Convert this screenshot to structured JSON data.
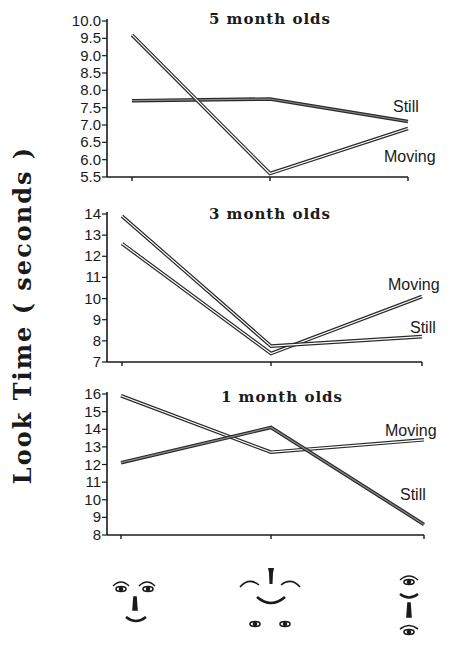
{
  "figure": {
    "ylabel": "Look Time ( seconds )"
  },
  "chart_data": [
    {
      "type": "line",
      "title": "5 month olds",
      "xlabel": "",
      "ylabel": "Look Time ( seconds )",
      "categories": [
        "face-normal",
        "face-scrambled",
        "face-vertical"
      ],
      "ylim": [
        5.5,
        10.0
      ],
      "yticks": [
        "10.0",
        "9.5",
        "9.0",
        "8.5",
        "8.0",
        "7.5",
        "7.0",
        "6.5",
        "6.0",
        "5.5"
      ],
      "series": [
        {
          "name": "Still",
          "values": [
            7.7,
            7.75,
            7.1
          ]
        },
        {
          "name": "Moving",
          "values": [
            9.6,
            5.6,
            6.9
          ]
        }
      ],
      "grid": false,
      "legend": "inline labels at right end of lines"
    },
    {
      "type": "line",
      "title": "3 month olds",
      "xlabel": "",
      "ylabel": "Look Time ( seconds )",
      "categories": [
        "face-normal",
        "face-scrambled",
        "face-vertical"
      ],
      "ylim": [
        7,
        14
      ],
      "yticks": [
        "14",
        "13",
        "12",
        "11",
        "10",
        "9",
        "8",
        "7"
      ],
      "series": [
        {
          "name": "Moving",
          "values": [
            12.6,
            7.4,
            10.1
          ]
        },
        {
          "name": "Still",
          "values": [
            13.9,
            7.75,
            8.2
          ]
        }
      ],
      "grid": false,
      "legend": "inline labels at right end of lines"
    },
    {
      "type": "line",
      "title": "1 month olds",
      "xlabel": "",
      "ylabel": "Look Time ( seconds )",
      "categories": [
        "face-normal",
        "face-scrambled",
        "face-vertical"
      ],
      "ylim": [
        8,
        16
      ],
      "yticks": [
        "16",
        "15",
        "14",
        "13",
        "12",
        "11",
        "10",
        "9",
        "8"
      ],
      "series": [
        {
          "name": "Moving",
          "values": [
            15.9,
            12.7,
            13.4
          ]
        },
        {
          "name": "Still",
          "values": [
            12.1,
            14.1,
            8.6
          ]
        }
      ],
      "grid": false,
      "legend": "inline labels at right end of lines"
    }
  ],
  "layout": {
    "panels": [
      {
        "x0": 107,
        "x1": 408,
        "ytop": 21,
        "ybot": 177,
        "title_x": 270,
        "title_y": 24,
        "px": [
          132,
          270,
          408
        ],
        "labels": [
          {
            "series": 0,
            "x": 393,
            "y": 112
          },
          {
            "series": 1,
            "x": 384,
            "y": 162
          }
        ]
      },
      {
        "x0": 107,
        "x1": 422,
        "ytop": 214,
        "ybot": 362,
        "title_x": 270,
        "title_y": 219,
        "px": [
          122,
          271,
          422
        ],
        "labels": [
          {
            "series": 0,
            "x": 388,
            "y": 290
          },
          {
            "series": 1,
            "x": 410,
            "y": 333
          }
        ]
      },
      {
        "x0": 107,
        "x1": 424,
        "ytop": 394,
        "ybot": 535,
        "title_x": 282,
        "title_y": 402,
        "px": [
          121,
          271,
          424
        ],
        "labels": [
          {
            "series": 0,
            "x": 385,
            "y": 436
          },
          {
            "series": 1,
            "x": 400,
            "y": 500
          }
        ]
      }
    ]
  },
  "stimuli": [
    {
      "name": "face-normal"
    },
    {
      "name": "face-scrambled"
    },
    {
      "name": "face-vertical"
    }
  ]
}
